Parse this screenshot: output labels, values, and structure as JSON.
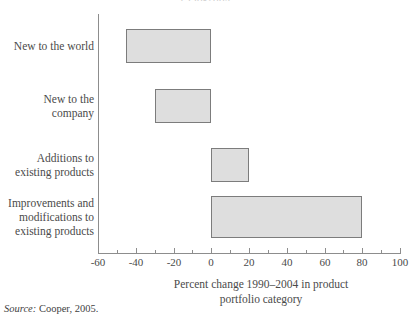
{
  "figure": {
    "clipped_top_title": "1990-2004",
    "source_note_label": "Source:",
    "source_note_text": " Cooper, 2005."
  },
  "chart_data": {
    "type": "bar",
    "orientation": "horizontal",
    "title": "",
    "xlabel": "Percent change 1990–2004 in product\nportfolio category",
    "ylabel": "",
    "categories": [
      "New to the world",
      "New to the\ncompany",
      "Additions to\nexisting products",
      "Improvements and\nmodifications to\nexisting products"
    ],
    "values": [
      -45,
      -30,
      20,
      80
    ],
    "xlim": [
      -60,
      100
    ],
    "xticks": [
      -60,
      -40,
      -20,
      0,
      20,
      40,
      60,
      80,
      100
    ],
    "xticklabels": [
      "-60",
      "-40",
      "-20",
      "0",
      "20",
      "40",
      "60",
      "80",
      "100"
    ],
    "minor_xticks": [
      -50,
      -30,
      -10,
      10,
      30,
      50,
      70,
      90
    ],
    "grid": false,
    "legend": null,
    "bar_fill_color": "#dedede",
    "bar_edge_color": "#7c7c7c",
    "axis_color": "#8d8d8d",
    "text_color": "#4a4a4a"
  }
}
